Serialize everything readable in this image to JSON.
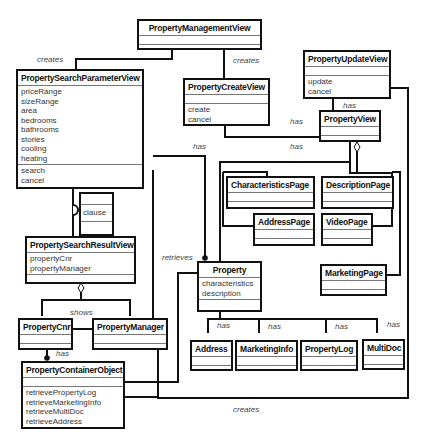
{
  "classes": {
    "pmv": {
      "name": "PropertyManagementView",
      "attributes": [],
      "operations": []
    },
    "pspv": {
      "name": "PropertySearchParameterView",
      "attributes": [
        "priceRange",
        "sizeRange",
        "area",
        "bedrooms",
        "bathrooms",
        "stories",
        "cooling",
        "heating"
      ],
      "operations": [
        "search",
        "cancel"
      ]
    },
    "pcv": {
      "name": "PropertyCreateView",
      "attributes": [],
      "operations": [
        "create",
        "cancel"
      ]
    },
    "puv": {
      "name": "PropertyUpdateView",
      "attributes": [],
      "operations": [
        "update",
        "cancel"
      ]
    },
    "pv": {
      "name": "PropertyView"
    },
    "clause": {
      "name": "clause"
    },
    "psrv": {
      "name": "PropertySearchResultView",
      "attributes": [
        "propertyCnr",
        "propertyManager"
      ]
    },
    "charPage": {
      "name": "CharacteristicsPage"
    },
    "descPage": {
      "name": "DescriptionPage"
    },
    "addrPage": {
      "name": "AddressPage"
    },
    "videoPage": {
      "name": "VideoPage"
    },
    "mktPage": {
      "name": "MarketingPage"
    },
    "property": {
      "name": "Property",
      "attributes": [
        "characteristics",
        "description"
      ]
    },
    "pcnr": {
      "name": "PropertyCnr"
    },
    "pmgr": {
      "name": "PropertyManager"
    },
    "pco": {
      "name": "PropertyContainerObject",
      "attributes": [],
      "operations": [
        "retrievePropertyLog",
        "retrieveMarketingInfo",
        "retrieveMultiDoc",
        "retrieveAddress"
      ]
    },
    "address": {
      "name": "Address"
    },
    "mktInfo": {
      "name": "MarketingInfo"
    },
    "plog": {
      "name": "PropertyLog"
    },
    "multidoc": {
      "name": "MultiDoc"
    }
  },
  "labels": {
    "creates1": "creates",
    "creates2": "creates",
    "has_pcv": "has",
    "has_puv": "has",
    "has_a": "has",
    "has_b": "has",
    "retrieves": "retrieves",
    "shows": "shows",
    "has_pco": "has",
    "has_addr": "has",
    "has_mkt": "has",
    "has_plog": "has",
    "has_multi": "has",
    "creates_bottom": "creates"
  }
}
